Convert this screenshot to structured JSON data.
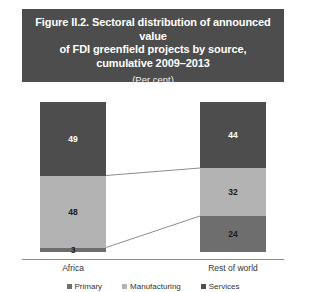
{
  "figure": {
    "title_line1": "Figure II.2. Sectoral distribution of announced value",
    "title_line2": "of FDI greenfield projects by source,",
    "title_line3": "cumulative 2009–2013",
    "subtitle": "(Per cent)"
  },
  "chart_data": {
    "type": "bar",
    "stacked": true,
    "stack_total": 100,
    "title": "Figure II.2. Sectoral distribution of announced value of FDI greenfield projects by source, cumulative 2009–2013",
    "subtitle": "(Per cent)",
    "xlabel": "",
    "ylabel": "",
    "ylim": [
      0,
      100
    ],
    "grid": false,
    "legend_position": "bottom",
    "categories": [
      "Africa",
      "Rest of world"
    ],
    "series": [
      {
        "name": "Primary",
        "values": [
          3,
          24
        ],
        "color": "#6e6e6e"
      },
      {
        "name": "Manufacturing",
        "values": [
          48,
          32
        ],
        "color": "#b3b3b3"
      },
      {
        "name": "Services",
        "values": [
          49,
          44
        ],
        "color": "#4d4d4d"
      }
    ],
    "labels": {
      "africa": {
        "services": "49",
        "manufacturing": "48",
        "primary": "3"
      },
      "rest_of_world": {
        "services": "44",
        "manufacturing": "32",
        "primary": "24"
      }
    },
    "connector_lines": true,
    "banner_color": "#4d4d4d"
  },
  "legend": {
    "items": [
      {
        "label": "Primary",
        "color": "#6e6e6e"
      },
      {
        "label": "Manufacturing",
        "color": "#b3b3b3"
      },
      {
        "label": "Services",
        "color": "#4d4d4d"
      }
    ]
  },
  "axis": {
    "categories": [
      {
        "label": "Africa"
      },
      {
        "label": "Rest of world"
      }
    ]
  }
}
